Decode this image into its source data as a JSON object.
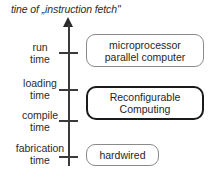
{
  "title": "tine of „instruction fetch\"",
  "axis": {
    "name": "time-axis",
    "direction": "upward",
    "arrow_icon": "arrow-up-icon",
    "tick_count": 4
  },
  "axis_labels": [
    {
      "line1": "run",
      "line2": "time",
      "top": 42
    },
    {
      "line1": "loading",
      "line2": "time",
      "top": 78
    },
    {
      "line1": "compile",
      "line2": "time",
      "top": 110
    },
    {
      "line1": "fabrication",
      "line2": "time",
      "top": 143
    }
  ],
  "ticks": [
    {
      "top": 52
    },
    {
      "top": 89
    },
    {
      "top": 120
    },
    {
      "top": 156
    }
  ],
  "boxes": [
    {
      "id": "microprocessor",
      "line1": "microprocessor",
      "line2": "parallel computer",
      "emphasis": false,
      "border_color": "#8a8a8a"
    },
    {
      "id": "reconfigurable",
      "line1": "Reconfigurable",
      "line2": "Computing",
      "emphasis": true,
      "border_color": "#1a1a1a"
    },
    {
      "id": "hardwired",
      "line1": "hardwired",
      "line2": "",
      "emphasis": false,
      "border_color": "#8a8a8a"
    }
  ],
  "colors": {
    "background": "#ffffff",
    "text": "#1f1f1f",
    "axis": "#3a3a3a",
    "box_border": "#8a8a8a",
    "emphasis_border": "#1a1a1a"
  }
}
